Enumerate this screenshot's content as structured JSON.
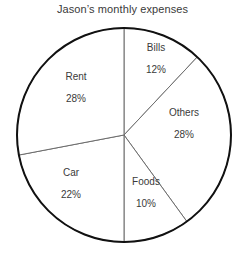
{
  "chart_data": {
    "type": "pie",
    "title": "Jason’s monthly expenses",
    "xlabel": "",
    "ylabel": "",
    "grid": false,
    "legend": "none",
    "labels_inside_slices": true,
    "start_angle_deg": 0,
    "direction": "clockwise",
    "categories": [
      "Bills",
      "Others",
      "Foods",
      "Car",
      "Rent"
    ],
    "values": [
      12,
      28,
      10,
      22,
      28
    ],
    "value_unit": "%",
    "total": 100,
    "slices": [
      {
        "name": "Bills",
        "value": 12,
        "value_label": "12%",
        "start_pct": 0,
        "end_pct": 12,
        "fill": "#ffffff",
        "label_x": 156,
        "label_y": 41
      },
      {
        "name": "Others",
        "value": 28,
        "value_label": "28%",
        "start_pct": 12,
        "end_pct": 40,
        "fill": "#ffffff",
        "label_x": 184,
        "label_y": 106
      },
      {
        "name": "Foods",
        "value": 10,
        "value_label": "10%",
        "start_pct": 40,
        "end_pct": 50,
        "fill": "#ffffff",
        "label_x": 146,
        "label_y": 175
      },
      {
        "name": "Car",
        "value": 22,
        "value_label": "22%",
        "start_pct": 50,
        "end_pct": 72,
        "fill": "#ffffff",
        "label_x": 71,
        "label_y": 166
      },
      {
        "name": "Rent",
        "value": 28,
        "value_label": "28%",
        "start_pct": 72,
        "end_pct": 100,
        "fill": "#ffffff",
        "label_x": 76,
        "label_y": 70
      }
    ],
    "geometry": {
      "center_x": 124,
      "center_y": 135,
      "radius": 107
    },
    "colors": {
      "slice_fill": "#ffffff",
      "outline": "#111111",
      "divider": "#6d6d6d",
      "text": "#3a3a3a",
      "background": "#ffffff"
    }
  }
}
